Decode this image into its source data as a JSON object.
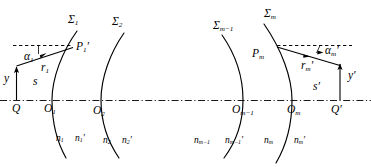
{
  "figure": {
    "type": "optical-ray-diagram",
    "background_color": "#ffffff",
    "stroke_color": "#000000",
    "width": 371,
    "height": 167
  },
  "surfaces": [
    {
      "id": "sigma-1",
      "label_glyph": "Σ",
      "label_sub": "1",
      "label_x": 68,
      "label_y": 14
    },
    {
      "id": "sigma-2",
      "label_glyph": "Σ",
      "label_sub": "2",
      "label_x": 110,
      "label_y": 16
    },
    {
      "id": "sigma-m-1",
      "label_glyph": "Σ",
      "label_sub": "m−1",
      "label_x": 215,
      "label_y": 20
    },
    {
      "id": "sigma-m",
      "label_glyph": "Σ",
      "label_sub": "m",
      "label_x": 263,
      "label_y": 9
    }
  ],
  "vertices": [
    {
      "id": "o-1",
      "label": "O",
      "sub": "1",
      "x": 47,
      "y": 100
    },
    {
      "id": "o-2",
      "label": "O",
      "sub": "2",
      "x": 90,
      "y": 102
    },
    {
      "id": "o-m-1",
      "label": "O",
      "sub": "m−1",
      "x": 248,
      "y": 101
    },
    {
      "id": "o-m",
      "label": "O",
      "sub": "m",
      "x": 298,
      "y": 101
    }
  ],
  "object_point": {
    "id": "Q",
    "label": "Q",
    "x": 14,
    "y": 100
  },
  "image_point": {
    "id": "Q-prime",
    "label": "Q′",
    "x": 333,
    "y": 101
  },
  "ray_points": [
    {
      "id": "P-1",
      "label": "P",
      "sub": "1",
      "prime": true,
      "x": 74,
      "y": 47
    },
    {
      "id": "P-m",
      "label": "P",
      "sub": "m",
      "prime": false,
      "x": 274,
      "y": 48
    }
  ],
  "heights": [
    {
      "id": "y",
      "label": "y",
      "x": 4,
      "y": 74
    },
    {
      "id": "y-prime",
      "label": "y′",
      "x": 349,
      "y": 73
    }
  ],
  "distances": [
    {
      "id": "s",
      "label": "s",
      "x": 34,
      "y": 77
    },
    {
      "id": "s-prime",
      "label": "s′",
      "x": 314,
      "y": 84
    }
  ],
  "radii": [
    {
      "id": "r-1",
      "label": "r",
      "sub": "1",
      "prime": false,
      "x": 43,
      "y": 66
    },
    {
      "id": "r-m-prime",
      "label": "r",
      "sub": "m",
      "prime": true,
      "x": 305,
      "y": 64
    }
  ],
  "angles": [
    {
      "id": "alpha-1",
      "glyph": "α",
      "sub": "1",
      "prime": false,
      "x": 25,
      "y": 54
    },
    {
      "id": "alpha-m-prime",
      "glyph": "α",
      "sub": "m",
      "prime": true,
      "x": 329,
      "y": 48
    }
  ],
  "refractive_indices": [
    {
      "id": "n-1",
      "label": "n",
      "sub": "1",
      "prime": false,
      "x": 57,
      "y": 137
    },
    {
      "id": "n-1-prime",
      "label": "n",
      "sub": "1",
      "prime": true,
      "x": 76,
      "y": 137
    },
    {
      "id": "n-2",
      "label": "n",
      "sub": "2",
      "prime": false,
      "x": 103,
      "y": 139
    },
    {
      "id": "n-2-prime",
      "label": "n",
      "sub": "2",
      "prime": true,
      "x": 122,
      "y": 139
    },
    {
      "id": "n-m-1",
      "label": "n",
      "sub": "m−1",
      "prime": false,
      "x": 196,
      "y": 139
    },
    {
      "id": "n-m-1-prime",
      "label": "n",
      "sub": "m−1",
      "prime": true,
      "x": 226,
      "y": 139
    },
    {
      "id": "n-m",
      "label": "n",
      "sub": "m",
      "prime": false,
      "x": 265,
      "y": 139
    },
    {
      "id": "n-m-prime",
      "label": "n",
      "sub": "m",
      "prime": true,
      "x": 296,
      "y": 139
    }
  ],
  "axis": {
    "id": "optical-axis",
    "style": "dash-dot",
    "y": 100,
    "x_start": 0,
    "x_end": 371
  },
  "construction_lines": [
    {
      "id": "dashed-left",
      "style": "dashed",
      "y": 45,
      "x_start": 13,
      "x_end": 73
    },
    {
      "id": "dashed-right",
      "style": "dashed",
      "y": 45,
      "x_start": 276,
      "x_end": 351
    }
  ]
}
